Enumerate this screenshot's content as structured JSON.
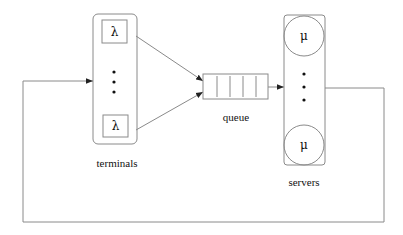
{
  "diagram": {
    "type": "closed queueing network",
    "colors": {
      "stroke": "#7a7a7a",
      "text": "#111111",
      "background": "#ffffff"
    },
    "terminals": {
      "label": "terminals",
      "rate_symbol_top": "λ",
      "rate_symbol_bottom": "λ",
      "ellipsis": "vertical-dots"
    },
    "queue": {
      "label": "queue",
      "slots": 5
    },
    "servers": {
      "label": "servers",
      "rate_symbol_top": "μ",
      "rate_symbol_bottom": "μ",
      "ellipsis": "vertical-dots"
    },
    "edges": [
      {
        "from": "terminals.top",
        "to": "queue"
      },
      {
        "from": "terminals.bottom",
        "to": "queue"
      },
      {
        "from": "queue",
        "to": "servers"
      },
      {
        "from": "servers",
        "to": "terminals",
        "note": "feedback loop"
      }
    ]
  }
}
